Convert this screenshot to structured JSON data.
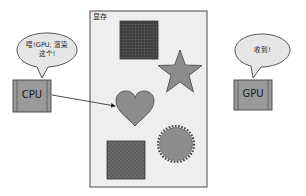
{
  "memory": {
    "label": "显存"
  },
  "cpu": {
    "label": "CPU",
    "speech_line1": "喂!GPU, 渲染",
    "speech_line2": "这个!"
  },
  "gpu": {
    "label": "GPU",
    "speech": "收到!"
  },
  "colors": {
    "memory_fill": "#eeeeee",
    "memory_border": "#555555",
    "chip_fill": "#9a9a9a",
    "shape_fill": "#8c8c8c",
    "dark_fill": "#5a5a5a",
    "bubble_fill": "#e6e6e6"
  },
  "shapes": [
    "grid-square",
    "star",
    "heart",
    "seal-circle",
    "textured-square"
  ]
}
